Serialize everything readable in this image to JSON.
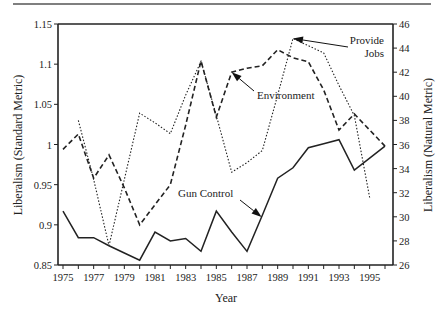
{
  "chart_data": {
    "type": "line",
    "title": "",
    "xlabel": "Year",
    "ylabel": "Liberalism (Standard Metric)",
    "y2label": "Liberalism (Natural Metric)",
    "xlim": [
      1975,
      1996
    ],
    "ylim": [
      0.85,
      1.15
    ],
    "y2lim": [
      26,
      46
    ],
    "grid": false,
    "legend": "none (lines labeled by annotations)",
    "x_ticks": [
      1975,
      1976,
      1977,
      1978,
      1979,
      1980,
      1981,
      1982,
      1983,
      1984,
      1985,
      1986,
      1987,
      1988,
      1989,
      1990,
      1991,
      1992,
      1993,
      1994,
      1995,
      1996
    ],
    "x_tick_labels": [
      "1975",
      "1977",
      "1979",
      "1981",
      "1983",
      "1985",
      "1987",
      "1989",
      "1991",
      "1993",
      "1995"
    ],
    "x_tick_label_values": [
      1975,
      1977,
      1979,
      1981,
      1983,
      1985,
      1987,
      1989,
      1991,
      1993,
      1995
    ],
    "y_ticks": [
      0.85,
      0.9,
      0.95,
      1.0,
      1.05,
      1.1,
      1.15
    ],
    "y_tick_labels": [
      "0.85",
      "0.9",
      "0.95",
      "1",
      "1.05",
      "1.1",
      "1.15"
    ],
    "y2_ticks": [
      26,
      28,
      30,
      32,
      34,
      36,
      38,
      40,
      42,
      44,
      46
    ],
    "y2_tick_labels": [
      "26",
      "28",
      "30",
      "32",
      "34",
      "36",
      "38",
      "40",
      "42",
      "44",
      "46"
    ],
    "series": [
      {
        "name": "Gun Control",
        "axis": "left",
        "style": "solid",
        "x": [
          1975,
          1976,
          1977,
          1978,
          1979,
          1980,
          1981,
          1982,
          1983,
          1984,
          1985,
          1986,
          1987,
          1988,
          1989,
          1990,
          1991,
          1992,
          1993,
          1994,
          1995,
          1996
        ],
        "values": [
          0.917,
          0.884,
          0.884,
          0.874,
          0.865,
          0.856,
          0.891,
          0.88,
          0.883,
          0.867,
          0.917,
          0.891,
          0.867,
          0.912,
          0.958,
          0.971,
          0.996,
          1.001,
          1.006,
          0.968,
          0.983,
          0.998
        ]
      },
      {
        "name": "Environment",
        "axis": "left",
        "style": "dashed",
        "x": [
          1975,
          1976,
          1977,
          1978,
          1979,
          1980,
          1981,
          1982,
          1983,
          1984,
          1985,
          1986,
          1987,
          1988,
          1989,
          1990,
          1991,
          1992,
          1993,
          1994,
          1995,
          1996
        ],
        "values": [
          0.994,
          1.013,
          0.958,
          0.987,
          0.946,
          0.9,
          0.925,
          0.95,
          1.024,
          1.104,
          1.034,
          1.09,
          1.095,
          1.098,
          1.118,
          1.108,
          1.103,
          1.068,
          1.018,
          1.038,
          1.018,
          0.998
        ]
      },
      {
        "name": "Provide Jobs",
        "axis": "right",
        "style": "dotted",
        "x": [
          1976,
          1977,
          1978,
          1979,
          1980,
          1981,
          1982,
          1983,
          1984,
          1985,
          1986,
          1987,
          1988,
          1989,
          1990,
          1991,
          1992,
          1993,
          1994,
          1995
        ],
        "values": [
          38.0,
          33.1,
          27.6,
          33.1,
          38.6,
          37.8,
          36.9,
          40.1,
          42.9,
          38.4,
          33.7,
          34.5,
          35.5,
          40.1,
          44.8,
          44.2,
          43.6,
          40.9,
          38.4,
          31.6
        ]
      }
    ],
    "annotations": [
      {
        "text_lines": [
          "Gun Control"
        ],
        "points_to_series": "Gun Control",
        "points_to_x": 1988
      },
      {
        "text_lines": [
          "Environment"
        ],
        "points_to_series": "Environment",
        "points_to_x": 1986
      },
      {
        "text_lines": [
          "Provide",
          "Jobs"
        ],
        "points_to_series": "Provide Jobs",
        "points_to_x": 1990
      }
    ]
  }
}
